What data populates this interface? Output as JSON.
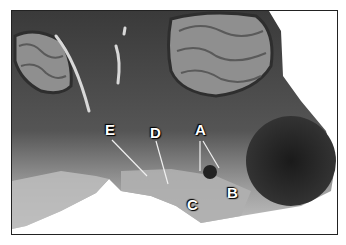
{
  "figure": {
    "labels": [
      {
        "id": "A",
        "text": "A",
        "x": 194,
        "y": 121
      },
      {
        "id": "B",
        "text": "B",
        "x": 226,
        "y": 184
      },
      {
        "id": "C",
        "text": "C",
        "x": 186,
        "y": 196
      },
      {
        "id": "D",
        "text": "D",
        "x": 149,
        "y": 124
      },
      {
        "id": "E",
        "text": "E",
        "x": 104,
        "y": 121
      }
    ],
    "colors": {
      "tissue_dark": "#2b2b2b",
      "tissue_mid": "#6a6a6a",
      "tissue_light": "#b4b4b4",
      "folia_light": "#9a9a9a",
      "border": "#222222",
      "background": "#ffffff"
    }
  }
}
